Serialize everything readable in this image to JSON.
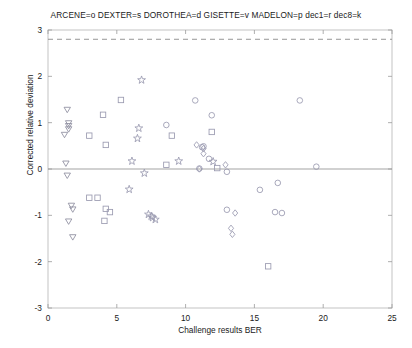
{
  "chart_data": {
    "type": "scatter",
    "title": "ARCENE=o DEXTER=s DOROTHEA=d GISETTE=v MADELON=p dec1=r dec8=k",
    "xlabel": "Challenge results BER",
    "ylabel": "Corrected relative deviation",
    "xlim": [
      0,
      25
    ],
    "ylim": [
      -3,
      3
    ],
    "xticks": [
      0,
      5,
      10,
      15,
      20,
      25
    ],
    "yticks": [
      -3,
      -2,
      -1,
      0,
      1,
      2,
      3
    ],
    "grid": false,
    "legend_position": "title",
    "reference_lines": [
      {
        "name": "zero-line",
        "y": 0,
        "style": "solid",
        "color": "#999999"
      },
      {
        "name": "threshold-line",
        "y": 2.8,
        "style": "dashed",
        "color": "#8a8a8a"
      }
    ],
    "marker_legend": [
      {
        "dataset": "ARCENE",
        "code": "o",
        "marker": "circle"
      },
      {
        "dataset": "DEXTER",
        "code": "s",
        "marker": "square"
      },
      {
        "dataset": "DOROTHEA",
        "code": "d",
        "marker": "diamond"
      },
      {
        "dataset": "GISETTE",
        "code": "v",
        "marker": "triangle-down"
      },
      {
        "dataset": "MADELON",
        "code": "p",
        "marker": "pentagram"
      },
      {
        "dataset": "dec1",
        "code": "r",
        "marker": "reference-1"
      },
      {
        "dataset": "dec8",
        "code": "k",
        "marker": "reference-8"
      }
    ],
    "series": [
      {
        "name": "GISETTE",
        "marker": "triangle-down",
        "color": "#8c8c9e",
        "points": [
          {
            "x": 1.4,
            "y": 1.28
          },
          {
            "x": 1.5,
            "y": 0.99
          },
          {
            "x": 1.5,
            "y": 0.93
          },
          {
            "x": 1.5,
            "y": 0.86
          },
          {
            "x": 1.2,
            "y": 0.74
          },
          {
            "x": 1.3,
            "y": 0.12
          },
          {
            "x": 1.4,
            "y": -0.14
          },
          {
            "x": 1.7,
            "y": -0.79
          },
          {
            "x": 1.8,
            "y": -0.87
          },
          {
            "x": 1.5,
            "y": -1.13
          },
          {
            "x": 1.8,
            "y": -1.47
          }
        ]
      },
      {
        "name": "DEXTER",
        "marker": "square",
        "color": "#9a9ab0",
        "points": [
          {
            "x": 5.3,
            "y": 1.49
          },
          {
            "x": 4.0,
            "y": 1.17
          },
          {
            "x": 3.0,
            "y": 0.72
          },
          {
            "x": 9.0,
            "y": 0.72
          },
          {
            "x": 11.9,
            "y": 0.8
          },
          {
            "x": 4.2,
            "y": 0.52
          },
          {
            "x": 8.6,
            "y": 0.09
          },
          {
            "x": 12.3,
            "y": 0.02
          },
          {
            "x": 3.0,
            "y": -0.62
          },
          {
            "x": 3.6,
            "y": -0.62
          },
          {
            "x": 4.2,
            "y": -0.86
          },
          {
            "x": 4.5,
            "y": -0.93
          },
          {
            "x": 4.1,
            "y": -1.12
          },
          {
            "x": 16.0,
            "y": -2.1
          }
        ]
      },
      {
        "name": "ARCENE",
        "marker": "circle",
        "color": "#9a9ab0",
        "points": [
          {
            "x": 10.7,
            "y": 1.48
          },
          {
            "x": 18.3,
            "y": 1.48
          },
          {
            "x": 11.9,
            "y": 1.16
          },
          {
            "x": 8.6,
            "y": 0.95
          },
          {
            "x": 11.3,
            "y": 0.49
          },
          {
            "x": 11.2,
            "y": 0.47
          },
          {
            "x": 11.7,
            "y": 0.22
          },
          {
            "x": 11.0,
            "y": 0.01
          },
          {
            "x": 13.0,
            "y": -0.06
          },
          {
            "x": 19.5,
            "y": 0.05
          },
          {
            "x": 16.7,
            "y": -0.3
          },
          {
            "x": 15.4,
            "y": -0.45
          },
          {
            "x": 13.0,
            "y": -0.88
          },
          {
            "x": 16.5,
            "y": -0.93
          },
          {
            "x": 17.0,
            "y": -0.95
          }
        ]
      },
      {
        "name": "DOROTHEA",
        "marker": "diamond",
        "color": "#9a9ab0",
        "points": [
          {
            "x": 10.8,
            "y": 0.52
          },
          {
            "x": 11.3,
            "y": 0.44
          },
          {
            "x": 11.3,
            "y": 0.33
          },
          {
            "x": 12.9,
            "y": 0.09
          },
          {
            "x": 11.0,
            "y": 0.0
          },
          {
            "x": 13.6,
            "y": -0.95
          },
          {
            "x": 13.3,
            "y": -1.28
          },
          {
            "x": 13.4,
            "y": -1.41
          }
        ]
      },
      {
        "name": "MADELON",
        "marker": "pentagram",
        "color": "#9a9ab0",
        "points": [
          {
            "x": 6.8,
            "y": 1.92
          },
          {
            "x": 6.6,
            "y": 0.88
          },
          {
            "x": 6.5,
            "y": 0.66
          },
          {
            "x": 6.1,
            "y": 0.17
          },
          {
            "x": 9.5,
            "y": 0.17
          },
          {
            "x": 12.0,
            "y": 0.16
          },
          {
            "x": 7.0,
            "y": -0.09
          },
          {
            "x": 5.9,
            "y": -0.44
          },
          {
            "x": 7.3,
            "y": -0.98
          },
          {
            "x": 7.5,
            "y": -1.02
          },
          {
            "x": 7.6,
            "y": -1.05
          },
          {
            "x": 7.8,
            "y": -1.09
          }
        ]
      }
    ]
  }
}
